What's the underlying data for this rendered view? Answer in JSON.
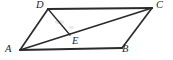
{
  "figure": {
    "type": "geometry-diagram",
    "canvas": {
      "width": 173,
      "height": 60,
      "background": "#ffffff"
    },
    "stroke_color": "#2b2b2b",
    "label_color": "#1f1f1f",
    "points": [
      {
        "id": "A",
        "label": "A",
        "x": 20,
        "y": 50,
        "label_x": 5,
        "label_y": 44
      },
      {
        "id": "B",
        "label": "B",
        "x": 122,
        "y": 48,
        "label_x": 122,
        "label_y": 44
      },
      {
        "id": "C",
        "label": "C",
        "x": 152,
        "y": 8,
        "label_x": 156,
        "label_y": 0
      },
      {
        "id": "D",
        "label": "D",
        "x": 48,
        "y": 9,
        "label_x": 36,
        "label_y": 0
      },
      {
        "id": "E",
        "label": "E",
        "x": 70,
        "y": 35,
        "label_x": 72,
        "label_y": 36
      }
    ],
    "segments": [
      {
        "id": "DC",
        "from": "D",
        "to": "C",
        "weight": "thick",
        "name": "side-dc"
      },
      {
        "id": "AB",
        "from": "A",
        "to": "B",
        "weight": "thick",
        "name": "side-ab"
      },
      {
        "id": "AD",
        "from": "A",
        "to": "D",
        "weight": "med",
        "name": "side-ad"
      },
      {
        "id": "BC",
        "from": "B",
        "to": "C",
        "weight": "med",
        "name": "side-bc"
      },
      {
        "id": "AC",
        "from": "A",
        "to": "C",
        "weight": "med",
        "name": "diagonal-ac"
      },
      {
        "id": "DE",
        "from": "D",
        "to": "E",
        "weight": "thin",
        "name": "segment-de"
      }
    ]
  }
}
